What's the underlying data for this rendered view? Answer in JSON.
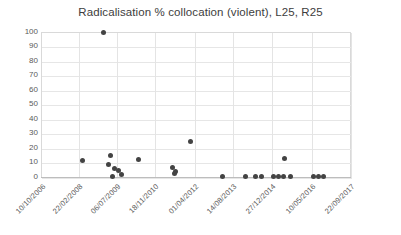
{
  "chart_data": {
    "type": "scatter",
    "title": "Radicalisation % collocation (violent), L25, R25",
    "xlabel": "",
    "ylabel": "",
    "ylim": [
      0,
      100
    ],
    "y_ticks": [
      100,
      90,
      80,
      70,
      60,
      50,
      40,
      30,
      20,
      10,
      0
    ],
    "x_ticks": [
      "10/10/2006",
      "22/02/2008",
      "06/07/2009",
      "18/11/2010",
      "01/04/2012",
      "14/08/2013",
      "27/12/2014",
      "10/05/2016",
      "22/09/2017"
    ],
    "grid": true,
    "legend": "none",
    "marker_color": "#434343",
    "points": [
      {
        "x": "2008-02-10",
        "y": 14
      },
      {
        "x": "2008-10-20",
        "y": 100
      },
      {
        "x": "2008-11-05",
        "y": 15.2
      },
      {
        "x": "2008-11-20",
        "y": 9.5
      },
      {
        "x": "2008-12-12",
        "y": 6.5
      },
      {
        "x": "2009-01-05",
        "y": 5.5
      },
      {
        "x": "2009-01-20",
        "y": 0.4
      },
      {
        "x": "2009-02-10",
        "y": 2.0
      },
      {
        "x": "2009-10-01",
        "y": 14.2
      },
      {
        "x": "2011-02-15",
        "y": 7.0
      },
      {
        "x": "2011-03-10",
        "y": 4.5
      },
      {
        "x": "2011-03-25",
        "y": 3.6
      },
      {
        "x": "2011-12-20",
        "y": 27.2
      },
      {
        "x": "2013-01-15",
        "y": 0.3
      },
      {
        "x": "2013-10-05",
        "y": 0.3
      },
      {
        "x": "2014-01-20",
        "y": 0.3
      },
      {
        "x": "2014-02-25",
        "y": 0.3
      },
      {
        "x": "2014-09-10",
        "y": 0.3
      },
      {
        "x": "2014-10-05",
        "y": 0.3
      },
      {
        "x": "2014-10-25",
        "y": 0.3
      },
      {
        "x": "2015-01-15",
        "y": 0.3
      },
      {
        "x": "2015-02-20",
        "y": 15.3
      },
      {
        "x": "2016-03-01",
        "y": 0.3
      },
      {
        "x": "2016-03-20",
        "y": 0.3
      },
      {
        "x": "2016-04-10",
        "y": 0.3
      }
    ],
    "point_pixels": [
      {
        "px": 82,
        "py": 160
      },
      {
        "px": 103,
        "py": 32
      },
      {
        "px": 110,
        "py": 155
      },
      {
        "px": 108,
        "py": 164
      },
      {
        "px": 114,
        "py": 168
      },
      {
        "px": 118,
        "py": 170
      },
      {
        "px": 112,
        "py": 176
      },
      {
        "px": 121,
        "py": 174
      },
      {
        "px": 138,
        "py": 159
      },
      {
        "px": 172,
        "py": 167
      },
      {
        "px": 175,
        "py": 171
      },
      {
        "px": 174,
        "py": 173
      },
      {
        "px": 190,
        "py": 141
      },
      {
        "px": 222,
        "py": 176
      },
      {
        "px": 245,
        "py": 176
      },
      {
        "px": 255,
        "py": 176
      },
      {
        "px": 261,
        "py": 176
      },
      {
        "px": 273,
        "py": 176
      },
      {
        "px": 278,
        "py": 176
      },
      {
        "px": 283,
        "py": 176
      },
      {
        "px": 290,
        "py": 176
      },
      {
        "px": 284,
        "py": 158
      },
      {
        "px": 313,
        "py": 176
      },
      {
        "px": 318,
        "py": 176
      },
      {
        "px": 323,
        "py": 176
      }
    ],
    "x_tick_pixels": [
      41,
      78,
      116,
      154,
      194,
      232,
      271,
      311,
      350
    ],
    "y_tick_pixels": [
      32,
      46,
      61,
      75,
      90,
      104,
      119,
      133,
      148,
      162,
      177
    ]
  }
}
